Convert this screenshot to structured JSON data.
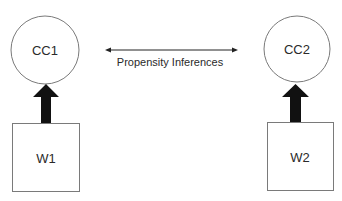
{
  "diagram": {
    "top_caption_partial": "",
    "nodes": [
      {
        "id": "CC1",
        "label": "CC1",
        "shape": "circle"
      },
      {
        "id": "CC2",
        "label": "CC2",
        "shape": "circle"
      },
      {
        "id": "W1",
        "label": "W1",
        "shape": "square"
      },
      {
        "id": "W2",
        "label": "W2",
        "shape": "square"
      }
    ],
    "edges": [
      {
        "from": "W1",
        "to": "CC1",
        "style": "thick-arrow"
      },
      {
        "from": "W2",
        "to": "CC2",
        "style": "thick-arrow"
      },
      {
        "from": "CC1",
        "to": "CC2",
        "style": "double-headed-thin",
        "label": "Propensity Inferences"
      }
    ],
    "colors": {
      "stroke": "#7a7a7a",
      "arrow": "#111111",
      "text": "#2a2a2a"
    }
  }
}
